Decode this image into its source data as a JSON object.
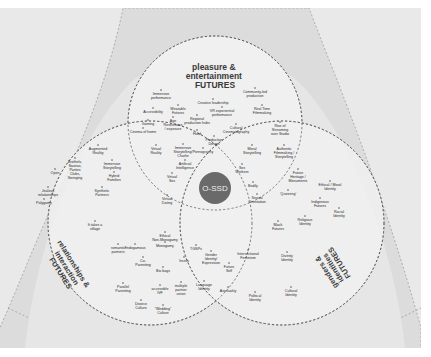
{
  "diagram": {
    "center": {
      "label": "O-SSD",
      "color": "#6a6a6a"
    },
    "circles": {
      "pleasure": {
        "title_lines": [
          "pleasure &",
          "entertainment",
          "FUTURES"
        ]
      },
      "relationships": {
        "title_lines": [
          "relationships &",
          "interaction",
          "FUTURES"
        ]
      },
      "identities": {
        "title_lines": [
          "genders &",
          "identities",
          "FUTURES"
        ]
      }
    },
    "colors": {
      "outer_background": "#e9e9e9",
      "outer_shape": "#dcdcdc",
      "inner_field": "#efefef",
      "dashed_line": "#555555",
      "center_circle": "#6a6a6a"
    },
    "nodes": [
      {
        "id": "immersive-performance",
        "lines": [
          "Immersive",
          "performance"
        ],
        "x": 161,
        "y": 93
      },
      {
        "id": "creative-leadership",
        "lines": [
          "Creative leadership"
        ],
        "x": 213,
        "y": 102
      },
      {
        "id": "community-led-production",
        "lines": [
          "Community-led",
          "production"
        ],
        "x": 255,
        "y": 91
      },
      {
        "id": "accessibility",
        "lines": [
          "Accessibility"
        ],
        "x": 153,
        "y": 111
      },
      {
        "id": "wearable-futures",
        "lines": [
          "Wearable",
          "Futures"
        ],
        "x": 178,
        "y": 108
      },
      {
        "id": "vr-experiential-performance",
        "lines": [
          "VR experiential",
          "performance"
        ],
        "x": 222,
        "y": 110
      },
      {
        "id": "real-time-filmmaking",
        "lines": [
          "Real Time",
          "Filmmaking"
        ],
        "x": 262,
        "y": 108
      },
      {
        "id": "gaming",
        "lines": [
          "Gaming"
        ],
        "x": 148,
        "y": 123
      },
      {
        "id": "age-restrictions",
        "lines": [
          "Age",
          "Restrictions",
          "/ exposure"
        ],
        "x": 173,
        "y": 120
      },
      {
        "id": "regional-production-hubs",
        "lines": [
          "Regional",
          "production hubs"
        ],
        "x": 197,
        "y": 118
      },
      {
        "id": "cultural-cinematography",
        "lines": [
          "Cultural",
          "Cinematography"
        ],
        "x": 236,
        "y": 127
      },
      {
        "id": "rise-of-streaming",
        "lines": [
          "Rise of",
          "Streaming",
          "over Studio"
        ],
        "x": 280,
        "y": 125
      },
      {
        "id": "cinema-of-home",
        "lines": [
          "Cinema of home"
        ],
        "x": 143,
        "y": 131
      },
      {
        "id": "food",
        "lines": [
          "Food"
        ],
        "x": 197,
        "y": 133
      },
      {
        "id": "production-design",
        "lines": [
          "Production",
          "Design"
        ],
        "x": 214,
        "y": 139
      },
      {
        "id": "virtual-reality",
        "lines": [
          "Virtual",
          "Reality"
        ],
        "x": 156,
        "y": 148
      },
      {
        "id": "immersive-storytelling-charlie",
        "lines": [
          "Immersive",
          "Storytelling/",
          "Charlie"
        ],
        "x": 183,
        "y": 147
      },
      {
        "id": "pornography",
        "lines": [
          "Pornography"
        ],
        "x": 203,
        "y": 151
      },
      {
        "id": "moral-storytelling",
        "lines": [
          "Moral",
          "Storytelling"
        ],
        "x": 252,
        "y": 148
      },
      {
        "id": "authentic-filmmaking",
        "lines": [
          "Authentic",
          "Filmmaking /",
          "Storytelling"
        ],
        "x": 284,
        "y": 148
      },
      {
        "id": "augmented-reality",
        "lines": [
          "Augmented",
          "Reality"
        ],
        "x": 98,
        "y": 148
      },
      {
        "id": "brothels-saunas",
        "lines": [
          "Brothels,",
          "Saunas,",
          "Parties",
          "Clubs,",
          "Swinging"
        ],
        "x": 75,
        "y": 161
      },
      {
        "id": "immersive-storytelling",
        "lines": [
          "Immersive",
          "Storytelling"
        ],
        "x": 112,
        "y": 163
      },
      {
        "id": "artificial-intelligence",
        "lines": [
          "Artificial",
          "Intelligence"
        ],
        "x": 185,
        "y": 163
      },
      {
        "id": "sex-workers",
        "lines": [
          "Sex",
          "Workers"
        ],
        "x": 242,
        "y": 167
      },
      {
        "id": "future-heritage",
        "lines": [
          "Future",
          "Heritage /",
          "Monuments"
        ],
        "x": 298,
        "y": 172
      },
      {
        "id": "ethical-moral-identity",
        "lines": [
          "Ethical / Moral",
          "Identity"
        ],
        "x": 330,
        "y": 184
      },
      {
        "id": "open",
        "lines": [
          "Open"
        ],
        "x": 55,
        "y": 172
      },
      {
        "id": "hybrid-families",
        "lines": [
          "Hybrid",
          "Families"
        ],
        "x": 114,
        "y": 175
      },
      {
        "id": "virtual-sex",
        "lines": [
          "Virtual",
          "Sex"
        ],
        "x": 172,
        "y": 176
      },
      {
        "id": "bodily",
        "lines": [
          "Bodily"
        ],
        "x": 253,
        "y": 185
      },
      {
        "id": "queering",
        "lines": [
          "'Queering'"
        ],
        "x": 288,
        "y": 193
      },
      {
        "id": "synthetic-partners",
        "lines": [
          "Synthetic",
          "Partners"
        ],
        "x": 102,
        "y": 190
      },
      {
        "id": "indigenous-futures",
        "lines": [
          "Indigenous",
          "Futures"
        ],
        "x": 320,
        "y": 201
      },
      {
        "id": "jealous-relationships",
        "lines": [
          "Jealous",
          "relationships"
        ],
        "x": 48,
        "y": 190
      },
      {
        "id": "sexual-orientation",
        "lines": [
          "Sexual",
          "Orientation"
        ],
        "x": 257,
        "y": 197
      },
      {
        "id": "virtual-dating",
        "lines": [
          "Virtual",
          "Dating"
        ],
        "x": 167,
        "y": 198
      },
      {
        "id": "polygamy",
        "lines": [
          "Polygamy"
        ],
        "x": 44,
        "y": 202
      },
      {
        "id": "racial-identity",
        "lines": [
          "Racial",
          "Identity"
        ],
        "x": 339,
        "y": 211
      },
      {
        "id": "black-futures",
        "lines": [
          "Black",
          "Futures"
        ],
        "x": 278,
        "y": 224
      },
      {
        "id": "religious-identity",
        "lines": [
          "Religious",
          "Identity"
        ],
        "x": 305,
        "y": 219
      },
      {
        "id": "it-takes-a-village",
        "lines": [
          "It takes a",
          "village"
        ],
        "x": 95,
        "y": 224
      },
      {
        "id": "ethical-non-monogamy",
        "lines": [
          "Ethical",
          "Non-Monogamy"
        ],
        "x": 165,
        "y": 235
      },
      {
        "id": "romantic-partners",
        "lines": [
          "romantic",
          "partners"
        ],
        "x": 118,
        "y": 247
      },
      {
        "id": "endogamous",
        "lines": [
          "Endogamous"
        ],
        "x": 135,
        "y": 247
      },
      {
        "id": "monogamy",
        "lines": [
          "Monogamy"
        ],
        "x": 165,
        "y": 245
      },
      {
        "id": "tgnps",
        "lines": [
          "TGNPs"
        ],
        "x": 196,
        "y": 248
      },
      {
        "id": "gender-identity-expression",
        "lines": [
          "Gender",
          "Identity/",
          "Expression"
        ],
        "x": 211,
        "y": 254
      },
      {
        "id": "intersectional-feminism",
        "lines": [
          "Intersectional",
          "Feminism"
        ],
        "x": 248,
        "y": 253
      },
      {
        "id": "divinity-identity",
        "lines": [
          "Divinity",
          "Identity"
        ],
        "x": 287,
        "y": 255
      },
      {
        "id": "co-parenting",
        "lines": [
          "Co-",
          "Parenting"
        ],
        "x": 143,
        "y": 260
      },
      {
        "id": "incels",
        "lines": [
          "Incels"
        ],
        "x": 184,
        "y": 260
      },
      {
        "id": "future-self",
        "lines": [
          "Future",
          "Self"
        ],
        "x": 229,
        "y": 266
      },
      {
        "id": "bio-bags",
        "lines": [
          "Bio bags"
        ],
        "x": 163,
        "y": 270
      },
      {
        "id": "parallel-parenting",
        "lines": [
          "Parallel",
          "Parenting"
        ],
        "x": 123,
        "y": 286
      },
      {
        "id": "accessible-ivf",
        "lines": [
          "accessible",
          "IVF"
        ],
        "x": 160,
        "y": 288
      },
      {
        "id": "multiple-partner-union",
        "lines": [
          "multiple",
          "partner",
          "union"
        ],
        "x": 181,
        "y": 285
      },
      {
        "id": "language-identity",
        "lines": [
          "Language",
          "Identity"
        ],
        "x": 204,
        "y": 284
      },
      {
        "id": "asexuality",
        "lines": [
          "Asexuality"
        ],
        "x": 228,
        "y": 290
      },
      {
        "id": "political-identity",
        "lines": [
          "Political",
          "Identity"
        ],
        "x": 255,
        "y": 295
      },
      {
        "id": "cultural-identity",
        "lines": [
          "Cultural",
          "Identity"
        ],
        "x": 291,
        "y": 290
      },
      {
        "id": "divorce-culture",
        "lines": [
          "Divorce",
          "Culture"
        ],
        "x": 141,
        "y": 303
      },
      {
        "id": "wedding-culture",
        "lines": [
          "\"Wedding\"",
          "Culture"
        ],
        "x": 163,
        "y": 308
      }
    ]
  }
}
